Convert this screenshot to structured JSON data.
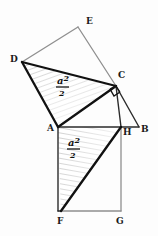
{
  "figure": {
    "background_color": "#fdfdfd",
    "ink_color": "#1a1a1a",
    "light_ink_color": "#8a8a8a",
    "shade_color": "#b8b8b8",
    "vertices": [
      {
        "id": "D",
        "label": "D",
        "x": 22,
        "y": 62,
        "label_x": 10,
        "label_y": 62
      },
      {
        "id": "E",
        "label": "E",
        "x": 78,
        "y": 27,
        "label_x": 86,
        "label_y": 24
      },
      {
        "id": "C",
        "label": "C",
        "x": 116,
        "y": 86,
        "label_x": 118,
        "label_y": 78
      },
      {
        "id": "A",
        "label": "A",
        "x": 58,
        "y": 127,
        "label_x": 48,
        "label_y": 131
      },
      {
        "id": "H",
        "label": "H",
        "x": 121,
        "y": 127,
        "label_x": 123,
        "label_y": 135
      },
      {
        "id": "B",
        "label": "B",
        "x": 139,
        "y": 127,
        "label_x": 140,
        "label_y": 132
      },
      {
        "id": "F",
        "label": "F",
        "x": 61,
        "y": 211,
        "label_x": 58,
        "label_y": 223
      },
      {
        "id": "G",
        "label": "G",
        "x": 121,
        "y": 211,
        "label_x": 117,
        "label_y": 223
      }
    ],
    "area_labels": [
      {
        "id": "upper-area",
        "numerator": "a",
        "exponent": "2",
        "denominator": "2",
        "x": 64,
        "y": 86
      },
      {
        "id": "lower-area",
        "numerator": "a",
        "exponent": "2",
        "denominator": "2",
        "x": 75,
        "y": 148
      }
    ],
    "right_angle_markers": [
      {
        "id": "right-angle-at-c",
        "x": 116,
        "y": 86
      }
    ],
    "shaded_regions": [
      {
        "id": "triangle-d-c-a",
        "points": "22,62 116,86 58,127"
      },
      {
        "id": "triangle-a-h-f",
        "points": "58,127 121,127 61,211"
      }
    ],
    "edges": [
      {
        "id": "edge-d-e",
        "from": "D",
        "to": "E",
        "weight": "light"
      },
      {
        "id": "edge-e-c",
        "from": "E",
        "to": "C",
        "weight": "light"
      },
      {
        "id": "edge-d-c",
        "from": "D",
        "to": "C",
        "weight": "heavy"
      },
      {
        "id": "edge-d-a",
        "from": "D",
        "to": "A",
        "weight": "heavy"
      },
      {
        "id": "edge-a-c",
        "from": "A",
        "to": "C",
        "weight": "heavy"
      },
      {
        "id": "edge-a-b",
        "from": "A",
        "to": "B",
        "weight": "medium"
      },
      {
        "id": "edge-c-b",
        "from": "C",
        "to": "B",
        "weight": "medium"
      },
      {
        "id": "edge-c-h",
        "from": "C",
        "to": "H",
        "weight": "medium"
      },
      {
        "id": "edge-a-f",
        "from": "A",
        "to": "F",
        "weight": "medium"
      },
      {
        "id": "edge-h-g",
        "from": "H",
        "to": "G",
        "weight": "light"
      },
      {
        "id": "edge-f-g",
        "from": "F",
        "to": "G",
        "weight": "light"
      },
      {
        "id": "edge-f-h",
        "from": "F",
        "to": "H",
        "weight": "heavy"
      }
    ]
  }
}
